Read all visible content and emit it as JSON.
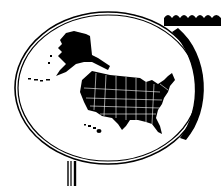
{
  "illustration": {
    "subject": "United States map inside magnifying-glass style oval frame",
    "colors": {
      "ink": "#000000",
      "background": "#ffffff",
      "state_border": "#ffffff"
    },
    "parts": [
      "wavy-banner",
      "oval-frame",
      "alaska",
      "hawaii",
      "contiguous-us",
      "stem"
    ]
  }
}
